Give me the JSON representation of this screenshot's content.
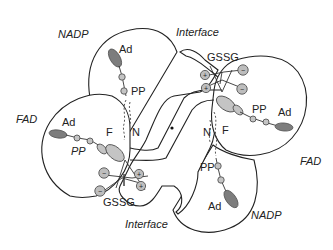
{
  "diagram": {
    "type": "schematic",
    "labels": {
      "nadp_top": "NADP",
      "nadp_bottom": "NADP",
      "fad_left": "FAD",
      "fad_right": "FAD",
      "interface_top": "Interface",
      "interface_bottom": "Interface",
      "gssg_top": "GSSG",
      "gssg_bottom": "GSSG"
    },
    "subunit_a": {
      "nadp_domain": {
        "ad": "Ad",
        "pp": "PP",
        "n": "N"
      },
      "fad_domain": {
        "ad": "Ad",
        "pp": "PP",
        "f": "F"
      }
    },
    "subunit_b": {
      "nadp_domain": {
        "ad": "Ad",
        "pp": "PP",
        "n": "N"
      },
      "fad_domain": {
        "ad": "Ad",
        "pp": "PP",
        "f": "F"
      }
    },
    "charges": {
      "plus": "+",
      "minus": "−"
    },
    "center_marker": "•"
  }
}
